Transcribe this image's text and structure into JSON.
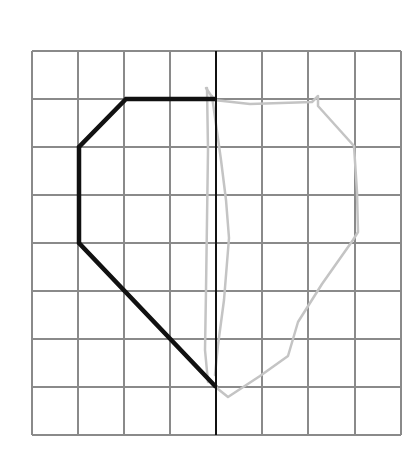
{
  "diagram": {
    "type": "symmetry-grid",
    "canvas": {
      "width": 419,
      "height": 465,
      "background": "#ffffff"
    },
    "grid": {
      "cols": 8,
      "rows": 8,
      "x_lines": [
        32,
        78,
        124,
        170,
        216,
        262,
        308,
        355,
        401
      ],
      "y_lines": [
        51,
        99,
        147,
        195,
        243,
        291,
        339,
        387,
        435
      ],
      "color": "#8a8a8a",
      "stroke_width": 2
    },
    "mirror_line": {
      "x": 216,
      "y1": 51,
      "y2": 435,
      "color": "#111111",
      "stroke_width": 2
    },
    "given_shape": {
      "color": "#111111",
      "stroke_width": 4.5,
      "points": [
        [
          216,
          99
        ],
        [
          126,
          99
        ],
        [
          79,
          147
        ],
        [
          79,
          243
        ],
        [
          216,
          387
        ]
      ]
    },
    "sketched_reflection": {
      "color": "#c4c4c4",
      "stroke_width": 2.5,
      "outline": [
        [
          206,
          88
        ],
        [
          214,
          100
        ],
        [
          250,
          104
        ],
        [
          312,
          102
        ],
        [
          318,
          96
        ],
        [
          318,
          106
        ],
        [
          354,
          146
        ],
        [
          357,
          192
        ],
        [
          358,
          232
        ],
        [
          353,
          240
        ],
        [
          322,
          284
        ],
        [
          298,
          322
        ],
        [
          288,
          356
        ],
        [
          260,
          376
        ],
        [
          228,
          397
        ],
        [
          213,
          385
        ]
      ],
      "inner_strokes": [
        [
          [
            207,
            88
          ],
          [
            208,
            150
          ],
          [
            207,
            220
          ],
          [
            206,
            290
          ],
          [
            205,
            350
          ],
          [
            208,
            382
          ]
        ],
        [
          [
            212,
            96
          ],
          [
            221,
            160
          ],
          [
            226,
            200
          ],
          [
            229,
            238
          ],
          [
            224,
            300
          ],
          [
            218,
            345
          ],
          [
            215,
            375
          ]
        ]
      ]
    }
  }
}
